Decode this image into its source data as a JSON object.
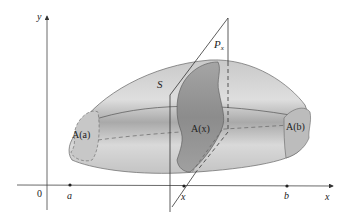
{
  "figure": {
    "axes": {
      "y_label": "y",
      "x_label": "x",
      "origin_label": "0"
    },
    "x_ticks": [
      {
        "label": "a"
      },
      {
        "label": "x"
      },
      {
        "label": "b"
      }
    ],
    "labels": {
      "solid": "S",
      "plane": "P",
      "plane_sub": "x",
      "area_a": "A(a)",
      "area_x": "A(x)",
      "area_b": "A(b)"
    },
    "colors": {
      "solid_light": "#d8d8d8",
      "solid_mid": "#b4b4b4",
      "solid_dark": "#8f8f8f",
      "cross_section": "#9a9a9a",
      "end_caps": "#bdbdbd",
      "lines": "#333333"
    }
  }
}
